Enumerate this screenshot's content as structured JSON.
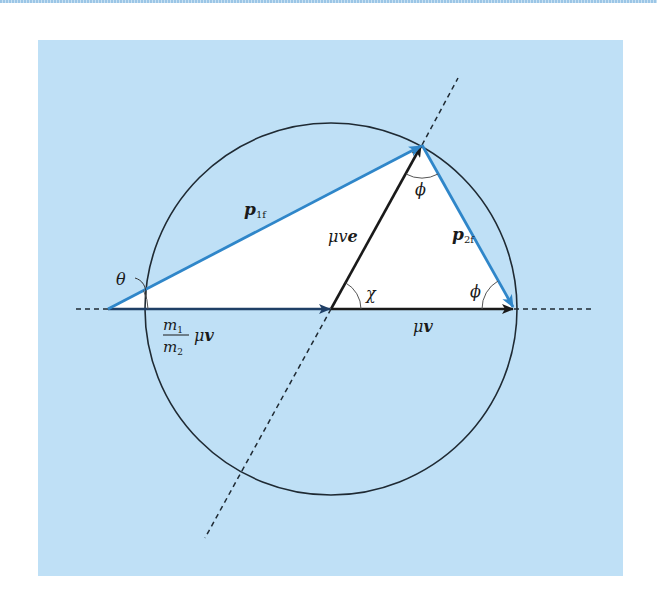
{
  "figure": {
    "colors": {
      "background_panel": "#bfe0f6",
      "triangle_fill": "#ffffff",
      "blue_vector": "#2f86c9",
      "black_vector": "#1a1a1a",
      "circle": "#1f2a33"
    },
    "labels": {
      "p1f_main": "p",
      "p1f_sub": "1f",
      "p2f_main": "p",
      "p2f_sub": "2f",
      "mu_v_e": "μv",
      "mu_v_e_bold": "e",
      "mu_v": "μ",
      "mu_v_bold": "v",
      "mass_ratio_num": "m",
      "mass_ratio_num_sub": "1",
      "mass_ratio_den": "m",
      "mass_ratio_den_sub": "2",
      "mass_ratio_tail": "μ",
      "mass_ratio_tail_bold": "v",
      "theta": "θ",
      "chi": "χ",
      "phi_top": "ϕ",
      "phi_right": "ϕ"
    },
    "geometry": {
      "circle_center": [
        331,
        309
      ],
      "circle_radius": 186,
      "left_vertex": [
        108,
        309
      ],
      "top_vertex": [
        422,
        145
      ],
      "right_vertex": [
        514,
        309
      ]
    }
  }
}
